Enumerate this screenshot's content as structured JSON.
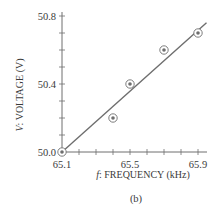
{
  "chart_data": {
    "type": "scatter",
    "title": "",
    "caption": "(b)",
    "xlabel_var": "f",
    "xlabel_text": ": FREQUENCY (kHz)",
    "ylabel_var": "V",
    "ylabel_text": ": VOLTAGE (V)",
    "xlim": [
      65.1,
      65.9
    ],
    "ylim": [
      50.0,
      50.8
    ],
    "x_tick_labels": [
      "65.1",
      "65.5",
      "65.9"
    ],
    "y_tick_labels": [
      "50.0",
      "50.4",
      "50.8"
    ],
    "x_minor_step": 0.1,
    "y_minor_step": 0.1,
    "grid": false,
    "legend": null,
    "series": [
      {
        "name": "measured",
        "marker": "circled-dot",
        "points": [
          {
            "x": 65.1,
            "y": 50.0
          },
          {
            "x": 65.4,
            "y": 50.2
          },
          {
            "x": 65.5,
            "y": 50.4
          },
          {
            "x": 65.7,
            "y": 50.6
          },
          {
            "x": 65.9,
            "y": 50.7
          }
        ]
      },
      {
        "name": "fit-line",
        "marker": "none",
        "points": [
          {
            "x": 65.1,
            "y": 50.0
          },
          {
            "x": 65.95,
            "y": 50.76
          }
        ]
      }
    ],
    "colors": {
      "axis": "#6e6e6e",
      "line": "#6e6e6e",
      "marker": "#6e6e6e",
      "text": "#3a3a3a"
    }
  }
}
